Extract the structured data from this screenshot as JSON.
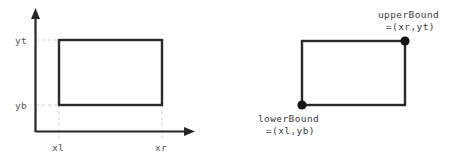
{
  "figure": {
    "colors": {
      "axis": "#272727",
      "rect_stroke": "#2a2a2a",
      "guide": "#d2d2d2",
      "dot": "#151515",
      "tick_label": "#555555",
      "callout_label": "#3a3a3a",
      "background": "#ffffff"
    },
    "left_diagram": {
      "name": "axes-rectangle-diagram",
      "axes": {
        "x_axis_name": "x-axis",
        "y_axis_name": "y-axis"
      },
      "rect": {
        "left": 59,
        "right": 162,
        "top": 40,
        "bottom": 105
      },
      "tick_labels": {
        "y_top": "yt",
        "y_bottom": "yb",
        "x_left": "xl",
        "x_right": "xr"
      }
    },
    "right_diagram": {
      "name": "labelled-rectangle-diagram",
      "rect": {
        "left": 302,
        "right": 405,
        "top": 41,
        "bottom": 105
      },
      "upper_bound": {
        "label": "upperBound",
        "value": "=(xr,yt)",
        "point_name": "upper-bound-point"
      },
      "lower_bound": {
        "label": "lowerBound",
        "value": "=(xl,yb)",
        "point_name": "lower-bound-point"
      }
    }
  }
}
